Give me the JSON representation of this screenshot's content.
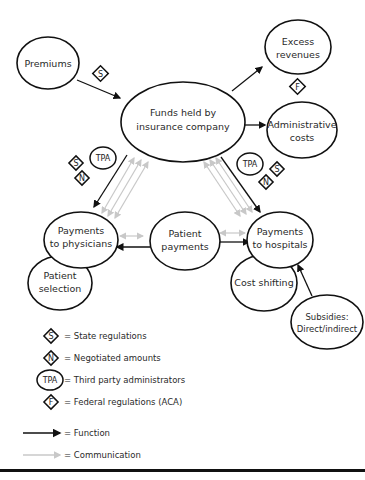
{
  "diagram": {
    "nodes": {
      "premiums": "Premiums",
      "funds_line1": "Funds held by",
      "funds_line2": "insurance company",
      "excess_line1": "Excess",
      "excess_line2": "revenues",
      "admin_line1": "Administrative",
      "admin_line2": "costs",
      "phys_line1": "Payments",
      "phys_line2": "to physicians",
      "patient_pay_line1": "Patient",
      "patient_pay_line2": "payments",
      "hosp_line1": "Payments",
      "hosp_line2": "to hospitals",
      "selection_line1": "Patient",
      "selection_line2": "selection",
      "cost_shifting": "Cost shifting",
      "subsidies_line1": "Subsidies:",
      "subsidies_line2": "Direct/indirect"
    },
    "badges": {
      "state": "S",
      "negotiated": "N",
      "tpa": "TPA",
      "federal": "F"
    },
    "legend": {
      "state": "= State regulations",
      "negotiated": "= Negotiated amounts",
      "tpa": "= Third party administrators",
      "federal": "= Federal regulations (ACA)",
      "function": "= Function",
      "communication": "= Communication"
    },
    "colors": {
      "function_arrow": "#111111",
      "communication_arrow": "#c8c8c8",
      "outline": "#111111"
    }
  }
}
